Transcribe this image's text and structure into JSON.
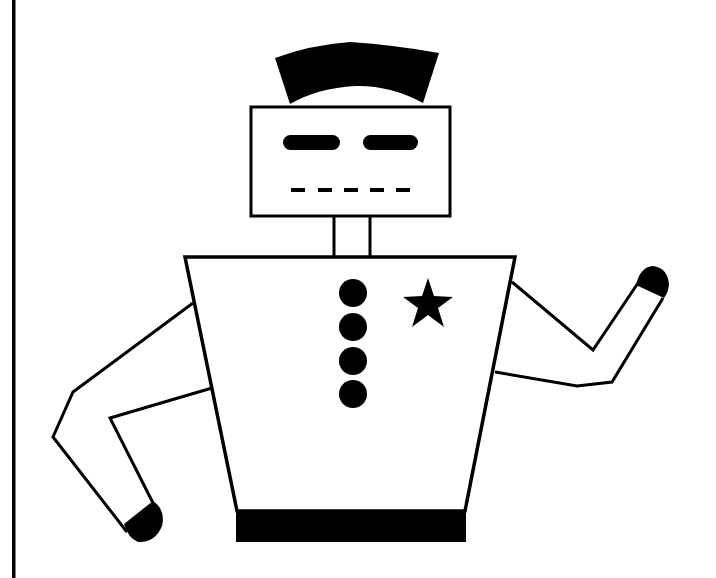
{
  "figure": {
    "colors": {
      "ink": "#000000",
      "paper": "#ffffff"
    },
    "elements": {
      "frame_left_border": {
        "x": 13,
        "y1": 0,
        "y2": 578
      },
      "hat": {
        "shape": "curved-trapezoid",
        "fill": "#000000"
      },
      "head": {
        "x": 250,
        "y": 107,
        "width": 200,
        "height": 109
      },
      "eyes": [
        {
          "x": 283,
          "y": 136,
          "width": 57,
          "height": 14
        },
        {
          "x": 363,
          "y": 136,
          "width": 55,
          "height": 14
        }
      ],
      "mouth_dashes": [
        {
          "x1": 291,
          "x2": 305
        },
        {
          "x1": 318,
          "x2": 332
        },
        {
          "x1": 344,
          "x2": 358
        },
        {
          "x1": 370,
          "x2": 384
        },
        {
          "x1": 396,
          "x2": 410
        }
      ],
      "neck": {
        "x1": 333,
        "x2": 370,
        "y1": 216,
        "y2": 257
      },
      "body": {
        "top_left": [
          185,
          257
        ],
        "top_right": [
          515,
          257
        ],
        "bottom_left": [
          237,
          511
        ],
        "bottom_right": [
          465,
          511
        ]
      },
      "belt": {
        "x": 237,
        "y": 511,
        "width": 228,
        "height": 31
      },
      "buttons": [
        {
          "cx": 353,
          "cy": 293,
          "r": 14
        },
        {
          "cx": 353,
          "cy": 327,
          "r": 14
        },
        {
          "cx": 353,
          "cy": 361,
          "r": 14
        },
        {
          "cx": 353,
          "cy": 394,
          "r": 14
        }
      ],
      "badge": {
        "shape": "star",
        "cx": 428,
        "cy": 305,
        "r": 26
      },
      "left_arm": {
        "pose": "bent down"
      },
      "right_arm": {
        "pose": "raised waving"
      }
    }
  }
}
